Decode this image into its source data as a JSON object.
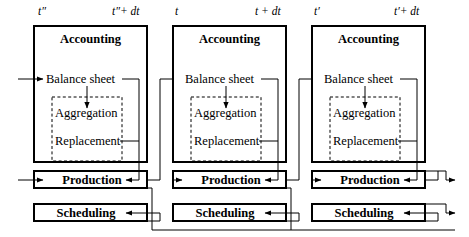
{
  "diagram": {
    "type": "block-flow",
    "background": "#ffffff",
    "line_color": "#000000",
    "panel_count": 3,
    "time_labels": [
      {
        "id": "t2-start",
        "text": "t″",
        "x": 38,
        "y": 14
      },
      {
        "id": "t2-end",
        "text": "t″+ dt",
        "x": 112,
        "y": 14
      },
      {
        "id": "t-start",
        "text": "t",
        "x": 174,
        "y": 14
      },
      {
        "id": "t-end",
        "text": "t + dt",
        "x": 255,
        "y": 14
      },
      {
        "id": "t1-start",
        "text": "t′",
        "x": 314,
        "y": 14
      },
      {
        "id": "t1-end",
        "text": "t′+ dt",
        "x": 394,
        "y": 14
      }
    ],
    "panels": [
      {
        "id": "panel-1",
        "period_start": "t″",
        "period_end": "t″+ dt",
        "x": 34,
        "y": 26,
        "w": 113,
        "h": 136,
        "header": "Accounting",
        "balance_sheet": "Balance sheet",
        "inner_group": {
          "label": "",
          "items": [
            "Aggregation",
            "Replacement"
          ]
        },
        "production": "Production",
        "scheduling": "Scheduling"
      },
      {
        "id": "panel-2",
        "period_start": "t",
        "period_end": "t + dt",
        "x": 173,
        "y": 26,
        "w": 113,
        "h": 136,
        "header": "Accounting",
        "balance_sheet": "Balance sheet",
        "inner_group": {
          "label": "",
          "items": [
            "Aggregation",
            "Replacement"
          ]
        },
        "production": "Production",
        "scheduling": "Scheduling"
      },
      {
        "id": "panel-3",
        "period_start": "t′",
        "period_end": "t′+ dt",
        "x": 312,
        "y": 26,
        "w": 113,
        "h": 136,
        "header": "Accounting",
        "balance_sheet": "Balance sheet",
        "inner_group": {
          "label": "",
          "items": [
            "Aggregation",
            "Replacement"
          ]
        },
        "production": "Production",
        "scheduling": "Scheduling"
      }
    ],
    "rows": {
      "production_label": "Production",
      "scheduling_label": "Scheduling",
      "production_y": 171,
      "scheduling_y": 204,
      "bar_height": 17
    },
    "nodes": {
      "header": "Accounting",
      "balance_sheet": "Balance sheet",
      "aggregation": "Aggregation",
      "replacement": "Replacement",
      "production": "Production",
      "scheduling": "Scheduling"
    }
  }
}
